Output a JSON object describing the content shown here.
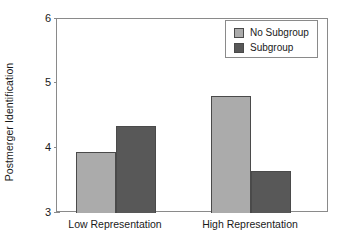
{
  "chart_data": {
    "type": "bar",
    "title": "",
    "xlabel": "",
    "ylabel": "Postmerger Identification",
    "categories": [
      "Low Representation",
      "High Representation"
    ],
    "series": [
      {
        "name": "No Subgroup",
        "color": "#ababab",
        "values": [
          3.94,
          4.81
        ]
      },
      {
        "name": "Subgroup",
        "color": "#585858",
        "values": [
          4.34,
          3.65
        ]
      }
    ],
    "ylim": [
      3,
      6
    ],
    "yticks": [
      "3",
      "4",
      "5",
      "6"
    ],
    "ytick_values": [
      3,
      4,
      5,
      6
    ],
    "grid": false,
    "legend_position": "top-right",
    "legend_entries": [
      "No Subgroup",
      "Subgroup"
    ],
    "frame": true,
    "bar_edge_color": "#4a4a4a",
    "axis_color": "#8a8a8a",
    "background": "#ffffff",
    "text_color": "#1a1a1a"
  }
}
